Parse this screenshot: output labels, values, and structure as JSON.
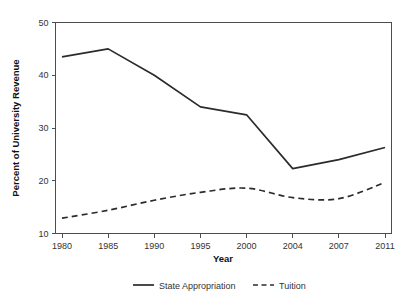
{
  "chart_data": {
    "type": "line",
    "title": "",
    "subtitle": "",
    "xlabel": "Year",
    "ylabel": "Percent of University Revenue",
    "categories": [
      "1980",
      "1985",
      "1990",
      "1995",
      "2000",
      "2004",
      "2007",
      "2011"
    ],
    "x_tick_labels": [
      "1980",
      "1985",
      "1990",
      "1995",
      "2000",
      "2004",
      "2007",
      "2011"
    ],
    "y_tick_labels": [
      "10",
      "20",
      "30",
      "40",
      "50"
    ],
    "y_ticks": [
      10,
      20,
      30,
      40,
      50
    ],
    "ylim": [
      10,
      50
    ],
    "grid": false,
    "legend_position": "bottom",
    "series": [
      {
        "name": "State Appropriation",
        "style": "solid",
        "color": "#2b2b2b",
        "values": [
          43.5,
          45.0,
          40.0,
          34.0,
          32.5,
          22.3,
          24.0,
          26.3
        ]
      },
      {
        "name": "Tuition",
        "style": "dashed",
        "color": "#2b2b2b",
        "values": [
          12.9,
          14.4,
          16.3,
          17.8,
          18.6,
          16.8,
          16.6,
          19.7
        ]
      }
    ]
  },
  "legend": {
    "entries": [
      {
        "label": "State Appropriation",
        "style": "solid"
      },
      {
        "label": "Tuition",
        "style": "dashed"
      }
    ]
  },
  "axes": {
    "x_title": "Year",
    "y_title": "Percent of University Revenue"
  }
}
